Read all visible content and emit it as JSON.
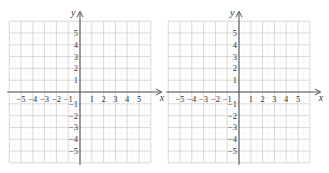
{
  "graphs": [
    {
      "id": "left",
      "x_label": "x",
      "y_label": "y",
      "x_range": [
        -6,
        6
      ],
      "y_range": [
        -6,
        6
      ],
      "x_tick_labels": [
        "−5",
        "−4",
        "−3",
        "−2",
        "−1",
        "1",
        "2",
        "3",
        "4",
        "5"
      ],
      "y_tick_labels": [
        "5",
        "4",
        "3",
        "2",
        "1",
        "−1",
        "−2",
        "−3",
        "−4",
        "−5"
      ]
    },
    {
      "id": "right",
      "x_label": "x",
      "y_label": "y",
      "x_range": [
        -6,
        6
      ],
      "y_range": [
        -6,
        6
      ],
      "x_tick_labels": [
        "−5",
        "−4",
        "−3",
        "−2",
        "−1",
        "1",
        "2",
        "3",
        "4",
        "5"
      ],
      "y_tick_labels": [
        "5",
        "4",
        "3",
        "2",
        "1",
        "−1",
        "−2",
        "−3",
        "−4",
        "−5"
      ]
    }
  ],
  "colors": {
    "grid": "#cfcfcf",
    "grid_minor": "#e2e2e2",
    "axis": "#555555",
    "text": "#333333"
  }
}
